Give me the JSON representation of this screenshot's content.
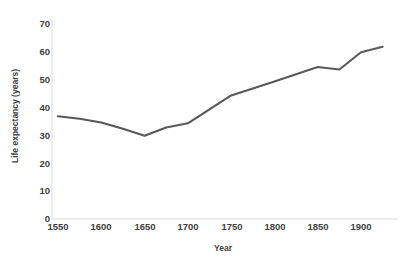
{
  "chart_data": {
    "type": "line",
    "title": "",
    "xlabel": "Year",
    "ylabel": "Life expectancy (years)",
    "xlim": [
      1535,
      1930
    ],
    "ylim": [
      0,
      70
    ],
    "xticks": [
      1550,
      1600,
      1650,
      1700,
      1750,
      1800,
      1850,
      1900
    ],
    "yticks": [
      0,
      10,
      20,
      30,
      40,
      50,
      60,
      70
    ],
    "grid": false,
    "legend": null,
    "series": [
      {
        "name": "Life expectancy",
        "color": "#595959",
        "x": [
          1550,
          1575,
          1600,
          1625,
          1650,
          1675,
          1700,
          1725,
          1750,
          1800,
          1850,
          1875,
          1900,
          1925
        ],
        "values": [
          36.5,
          35.6,
          34.3,
          32.0,
          29.5,
          32.5,
          34.0,
          39.0,
          44.0,
          49.0,
          54.2,
          53.3,
          59.5,
          61.5
        ]
      }
    ]
  },
  "axis": {
    "y_title": "Life expectancy (years)",
    "x_title": "Year",
    "y_tick_labels": [
      "70",
      "60",
      "50",
      "40",
      "30",
      "20",
      "10",
      "0"
    ],
    "x_tick_labels": [
      "1550",
      "1600",
      "1650",
      "1700",
      "1750",
      "1800",
      "1850",
      "1900"
    ]
  },
  "style": {
    "line_color": "#595959",
    "axis_color": "#d9d9d9",
    "text_color": "#3f3f3f",
    "background": "#ffffff"
  }
}
